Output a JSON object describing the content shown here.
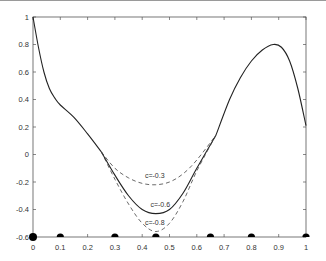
{
  "chart_data": {
    "type": "line",
    "title": "",
    "xlabel": "",
    "ylabel": "",
    "xlim": [
      0,
      1
    ],
    "ylim": [
      -0.6,
      1
    ],
    "grid": false,
    "legend": "none (inline curve annotations)",
    "x_ticks": [
      "0",
      "0.1",
      "0.2",
      "0.3",
      "0.4",
      "0.5",
      "0.6",
      "0.7",
      "0.8",
      "0.9",
      "1"
    ],
    "y_ticks": [
      "1",
      "0.8",
      "0.6",
      "0.4",
      "0.2",
      "0",
      "-0.2",
      "-0.4",
      "-0.6"
    ],
    "series": [
      {
        "name": "base curve",
        "style": "solid",
        "x": [
          0,
          0.02,
          0.04,
          0.06,
          0.08,
          0.1,
          0.15,
          0.2,
          0.25
        ],
        "y": [
          1.0,
          0.78,
          0.6,
          0.48,
          0.41,
          0.36,
          0.27,
          0.15,
          0.02
        ]
      },
      {
        "name": "c=-0.3",
        "style": "dashed",
        "x": [
          0.25,
          0.3,
          0.35,
          0.4,
          0.45,
          0.5,
          0.55,
          0.6,
          0.67
        ],
        "y": [
          0.02,
          -0.1,
          -0.17,
          -0.21,
          -0.22,
          -0.2,
          -0.14,
          -0.04,
          0.14
        ]
      },
      {
        "name": "c=-0.6",
        "style": "solid",
        "x": [
          0.25,
          0.3,
          0.35,
          0.4,
          0.45,
          0.5,
          0.55,
          0.6,
          0.67
        ],
        "y": [
          0.02,
          -0.15,
          -0.3,
          -0.4,
          -0.43,
          -0.4,
          -0.28,
          -0.1,
          0.14
        ]
      },
      {
        "name": "c=-0.8",
        "style": "dashed",
        "x": [
          0.25,
          0.3,
          0.35,
          0.4,
          0.45,
          0.5,
          0.55,
          0.6,
          0.67
        ],
        "y": [
          0.02,
          -0.18,
          -0.36,
          -0.5,
          -0.56,
          -0.5,
          -0.34,
          -0.12,
          0.14
        ]
      },
      {
        "name": "base curve (right)",
        "style": "solid",
        "x": [
          0.67,
          0.72,
          0.76,
          0.8,
          0.84,
          0.88,
          0.91,
          0.94,
          0.97,
          1.0
        ],
        "y": [
          0.14,
          0.4,
          0.56,
          0.68,
          0.76,
          0.8,
          0.78,
          0.68,
          0.48,
          0.21
        ]
      }
    ],
    "annotations": [
      {
        "text": "c=-0.3",
        "x": 0.41,
        "y": -0.17
      },
      {
        "text": "c=-0.6",
        "x": 0.43,
        "y": -0.38
      },
      {
        "text": "c=-0.8",
        "x": 0.41,
        "y": -0.51
      }
    ],
    "markers": {
      "shape": "filled semicircle on x-axis",
      "x": [
        0,
        0.1,
        0.3,
        0.45,
        0.65,
        0.8,
        1
      ],
      "y": -0.6
    }
  }
}
